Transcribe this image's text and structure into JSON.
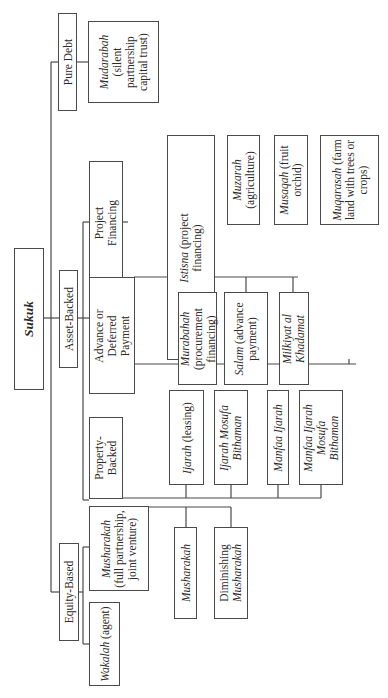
{
  "diagram": {
    "root": {
      "label": "Sukuk"
    },
    "categories": {
      "pure_debt": {
        "label": "Pure Debt"
      },
      "asset_backed": {
        "label": "Asset-Backed"
      },
      "equity_based": {
        "label": "Equity-Based"
      }
    },
    "pure_debt_children": {
      "mudarabah": {
        "italic": "Mudarabah",
        "rest": "(silent partnership capital trust)"
      }
    },
    "asset_backed_children": {
      "project_financing": {
        "label": "Project Financing"
      },
      "advance_deferred": {
        "label": "Advance or Deferred Payment"
      },
      "property_backed": {
        "label": "Property-Backed"
      }
    },
    "project_financing_children": {
      "istisna": {
        "italic": "Istisna",
        "rest": "(project financing)"
      },
      "muzarah": {
        "italic": "Muzarah",
        "rest": "(agriculture)"
      },
      "musaqah": {
        "italic": "Musaqah",
        "rest": "(fruit orchid)"
      },
      "muqarasah": {
        "italic": "Muqarasah",
        "rest": "(farm land with trees or crops)"
      }
    },
    "advance_deferred_children": {
      "murabahah": {
        "italic": "Murabahah",
        "rest": "(procurement financing)"
      },
      "salam": {
        "italic": "Salam",
        "rest": "(advance payment)"
      },
      "milkiyat": {
        "italic": "Milkiyat al Khadamat",
        "rest": ""
      }
    },
    "property_backed_children": {
      "ijarah": {
        "italic": "Ijarah",
        "rest": "(leasing)"
      },
      "ijarah_mosufa": {
        "italic": "Ijarah Mosufa Bithaman",
        "rest": ""
      },
      "manfaa_ijarah": {
        "italic": "Manfaa Ijarah",
        "rest": ""
      },
      "manfaa_ijarah_mosufa": {
        "italic": "Manfaa Ijarah Mosufa Bithaman",
        "rest": ""
      }
    },
    "equity_based_children": {
      "musharakah_full": {
        "italic": "Musharakah",
        "rest": "(full partnership, joint venture)"
      },
      "wakalah": {
        "italic": "Wakalah",
        "rest": "(agent)"
      }
    },
    "musharakah_children": {
      "musharakah": {
        "italic": "Musharakah",
        "rest": ""
      },
      "diminishing": {
        "plain": "Diminishing",
        "italic": "Musharakah"
      }
    },
    "colors": {
      "line": "#4a4a4a",
      "text": "#2a2a2a",
      "background": "#ffffff"
    }
  }
}
